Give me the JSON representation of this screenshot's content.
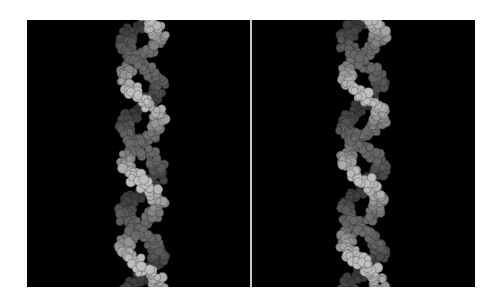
{
  "figure": {
    "type": "stereo-pair",
    "background_color": "#000000",
    "divider_color": "#c8c8c8",
    "panels": [
      {
        "id": "left",
        "label": "left-eye view",
        "helix_center_x": 115
      },
      {
        "id": "right",
        "label": "right-eye view",
        "helix_center_x": 111
      }
    ],
    "strands": [
      {
        "name": "strand-a",
        "color": "#bdbdbd"
      },
      {
        "name": "strand-b",
        "color": "#6e6e6e"
      }
    ],
    "helix": {
      "width": 46,
      "turns": 3.3,
      "height": 267
    }
  }
}
